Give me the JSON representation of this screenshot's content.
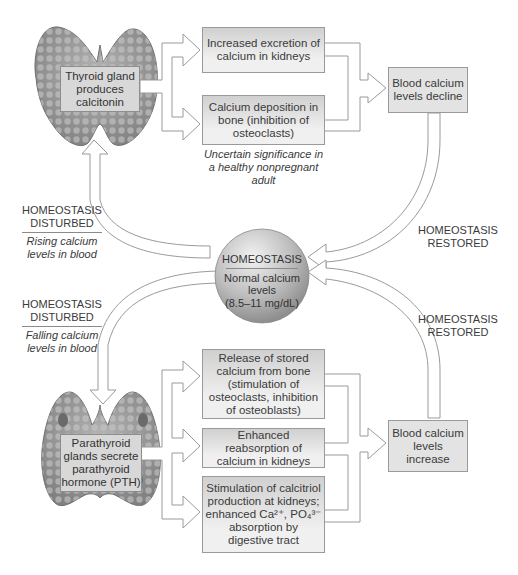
{
  "top_loop": {
    "gland_label": "Thyroid gland produces calcitonin",
    "effects": [
      "Increased excretion of calcium in kidneys",
      "Calcium deposition in bone (inhibition of osteoclasts)"
    ],
    "effect_note": "Uncertain significance in a healthy nonpregnant adult",
    "result": "Blood calcium levels decline",
    "disturbed_title": "HOMEOSTASIS DISTURBED",
    "disturbed_detail": "Rising calcium levels in blood",
    "restored": "HOMEOSTASIS RESTORED"
  },
  "center": {
    "title": "HOMEOSTASIS",
    "line1": "Normal calcium",
    "line2": "levels",
    "line3": "(8.5–11 mg/dL)"
  },
  "bottom_loop": {
    "gland_label": "Parathyroid glands secrete parathyroid hormone (PTH)",
    "effects": [
      "Release of stored calcium from bone (stimulation of osteoclasts, inhibition of osteoblasts)",
      "Enhanced reabsorption of calcium in kidneys",
      "Stimulation of calcitriol production at kidneys; enhanced Ca²⁺, PO₄³⁻ absorption by digestive tract"
    ],
    "result": "Blood calcium levels increase",
    "disturbed_title": "HOMEOSTASIS DISTURBED",
    "disturbed_detail": "Falling calcium levels in blood",
    "restored": "HOMEOSTASIS RESTORED"
  },
  "colors": {
    "box_fill": "#e0e0e0",
    "outline": "#9a9a9a",
    "gland": "#8f8f8f",
    "text": "#3a3a3a"
  }
}
